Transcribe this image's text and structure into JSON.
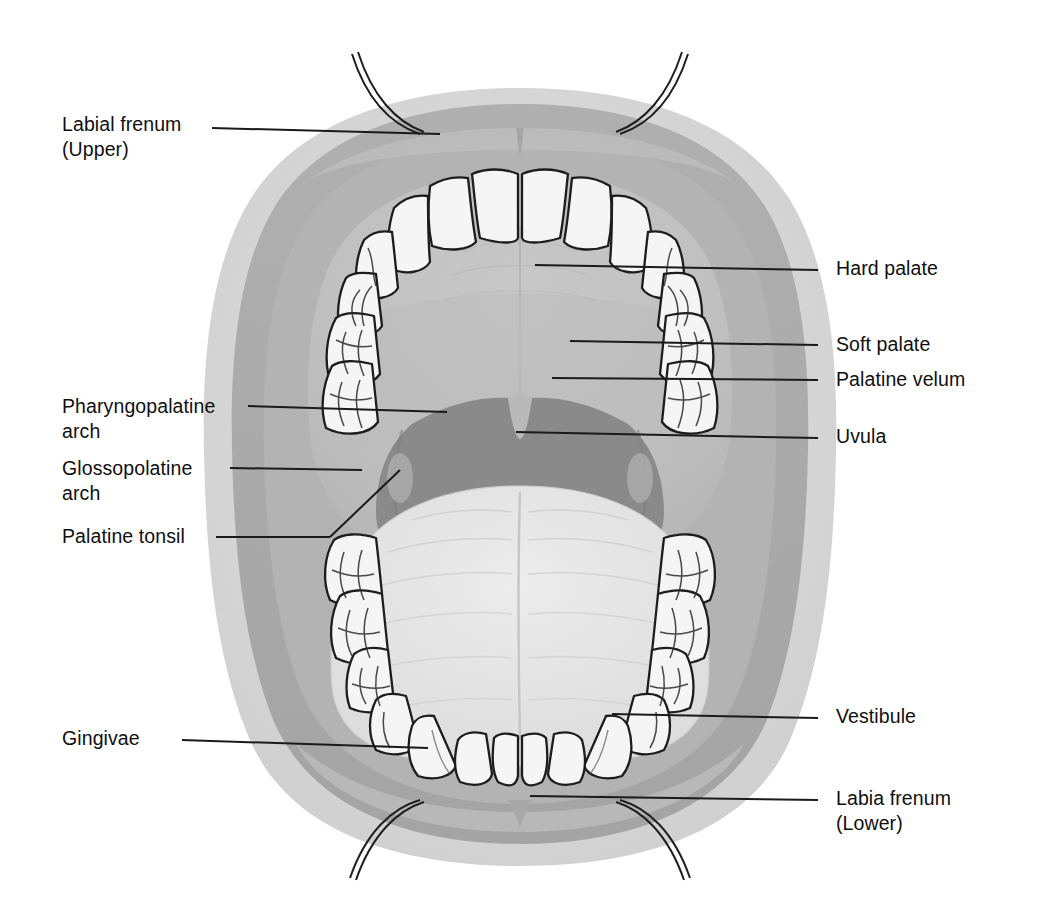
{
  "figure": {
    "colors": {
      "background": "#ffffff",
      "face_outer": "#d8d8d8",
      "lip_band": "#a9a9a9",
      "inner_mucosa": "#b5b5b5",
      "palate": "#c2c2c2",
      "oropharynx": "#8a8a8a",
      "tongue": "#e6e6e6",
      "tooth_fill": "#f4f4f4",
      "outline": "#1a1a1a",
      "leader_line": "#1a1a1a",
      "text": "#100f0f"
    }
  },
  "labels": {
    "left": [
      {
        "id": "labial-frenum-upper",
        "line1": "Labial frenum",
        "line2": "(Upper)",
        "text_x": 62,
        "text_y": 112,
        "leader": {
          "x1": 212,
          "y1": 128,
          "x2": 440,
          "y2": 134
        }
      },
      {
        "id": "pharyngopalatine-arch",
        "line1": "Pharyngopalatine",
        "line2": "arch",
        "text_x": 62,
        "text_y": 394,
        "leader": {
          "x1": 248,
          "y1": 406,
          "x2": 447,
          "y2": 412
        }
      },
      {
        "id": "glossopolatine-arch",
        "line1": "Glossopolatine",
        "line2": "arch",
        "text_x": 62,
        "text_y": 456,
        "leader": {
          "x1": 230,
          "y1": 468,
          "x2": 362,
          "y2": 470
        }
      },
      {
        "id": "palatine-tonsil",
        "line1": "Palatine tonsil",
        "line2": "",
        "text_x": 62,
        "text_y": 524,
        "leader": {
          "x1": 216,
          "y1": 537,
          "x2": 330,
          "y2": 537
        },
        "leader2": {
          "x1": 330,
          "y1": 537,
          "x2": 400,
          "y2": 470
        }
      },
      {
        "id": "gingivae",
        "line1": "Gingivae",
        "line2": "",
        "text_x": 62,
        "text_y": 726,
        "leader": {
          "x1": 182,
          "y1": 740,
          "x2": 428,
          "y2": 748
        }
      }
    ],
    "right": [
      {
        "id": "hard-palate",
        "line1": "Hard palate",
        "line2": "",
        "text_x": 836,
        "text_y": 256,
        "leader": {
          "x1": 535,
          "y1": 265,
          "x2": 818,
          "y2": 270
        }
      },
      {
        "id": "soft-palate",
        "line1": "Soft palate",
        "line2": "",
        "text_x": 836,
        "text_y": 332,
        "leader": {
          "x1": 570,
          "y1": 341,
          "x2": 818,
          "y2": 345
        }
      },
      {
        "id": "palatine-velum",
        "line1": "Palatine velum",
        "line2": "",
        "text_x": 836,
        "text_y": 367,
        "leader": {
          "x1": 552,
          "y1": 378,
          "x2": 818,
          "y2": 380
        }
      },
      {
        "id": "uvula",
        "line1": "Uvula",
        "line2": "",
        "text_x": 836,
        "text_y": 424,
        "leader": {
          "x1": 516,
          "y1": 432,
          "x2": 818,
          "y2": 438
        }
      },
      {
        "id": "vestibule",
        "line1": "Vestibule",
        "line2": "",
        "text_x": 836,
        "text_y": 704,
        "leader": {
          "x1": 612,
          "y1": 714,
          "x2": 818,
          "y2": 718
        }
      },
      {
        "id": "labia-frenum-lower",
        "line1": "Labia frenum",
        "line2": "(Lower)",
        "text_x": 836,
        "text_y": 786,
        "leader": {
          "x1": 530,
          "y1": 796,
          "x2": 818,
          "y2": 800
        }
      }
    ]
  },
  "structures": {
    "upper_arch_label": "Maxillary dental arch",
    "lower_arch_label": "Mandibular dental arch",
    "tongue_label": "Tongue",
    "oropharynx_label": "Oropharynx",
    "retractor_label": "Lip retractor"
  }
}
